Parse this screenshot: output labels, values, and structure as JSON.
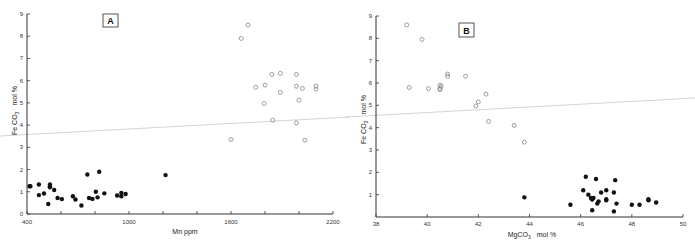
{
  "chart_data": [
    {
      "panel": "A",
      "type": "scatter",
      "title": "",
      "xlabel": "Mn  ppm",
      "ylabel": "Fe CO3  mol %",
      "xlim": [
        400,
        2200
      ],
      "ylim": [
        0,
        9
      ],
      "xticks": [
        400,
        600,
        800,
        1000,
        1200,
        1400,
        1600,
        1800,
        2000,
        2200
      ],
      "xtick_labels": [
        "400",
        "",
        "",
        "1000",
        "",
        "",
        "1600",
        "",
        "",
        "2200"
      ],
      "yticks": [
        0,
        1,
        2,
        3,
        4,
        5,
        6,
        7,
        8,
        9
      ],
      "grid": false,
      "series": [
        {
          "name": "filled",
          "marker": "filled-circle",
          "points": [
            [
              415,
              1.25
            ],
            [
              420,
              1.25
            ],
            [
              470,
              1.33
            ],
            [
              470,
              0.85
            ],
            [
              500,
              0.92
            ],
            [
              525,
              0.45
            ],
            [
              535,
              1.33
            ],
            [
              535,
              1.25
            ],
            [
              535,
              1.2
            ],
            [
              560,
              1.08
            ],
            [
              580,
              0.72
            ],
            [
              605,
              0.67
            ],
            [
              670,
              0.8
            ],
            [
              685,
              0.65
            ],
            [
              720,
              0.38
            ],
            [
              755,
              1.78
            ],
            [
              765,
              0.72
            ],
            [
              785,
              0.68
            ],
            [
              805,
              1.0
            ],
            [
              815,
              0.75
            ],
            [
              825,
              1.9
            ],
            [
              855,
              0.93
            ],
            [
              930,
              0.83
            ],
            [
              955,
              0.95
            ],
            [
              955,
              0.8
            ],
            [
              980,
              0.9
            ],
            [
              1215,
              1.75
            ]
          ]
        },
        {
          "name": "open",
          "marker": "open-circle",
          "points": [
            [
              1600,
              3.35
            ],
            [
              1660,
              7.9
            ],
            [
              1700,
              8.5
            ],
            [
              1745,
              5.7
            ],
            [
              1800,
              5.8
            ],
            [
              1795,
              4.97
            ],
            [
              1840,
              6.28
            ],
            [
              1845,
              4.22
            ],
            [
              1890,
              6.33
            ],
            [
              1890,
              5.47
            ],
            [
              1985,
              6.28
            ],
            [
              1985,
              5.75
            ],
            [
              1985,
              4.1
            ],
            [
              2000,
              5.12
            ],
            [
              2020,
              5.65
            ],
            [
              2035,
              3.32
            ],
            [
              2100,
              5.75
            ],
            [
              2100,
              5.62
            ]
          ]
        }
      ],
      "annotations": [
        "A"
      ]
    },
    {
      "panel": "B",
      "type": "scatter",
      "title": "",
      "xlabel": "MgCO3  mol %",
      "ylabel": "Fe CO3  mol %",
      "xlim": [
        38,
        50
      ],
      "ylim": [
        0,
        9
      ],
      "xticks": [
        38,
        40,
        42,
        44,
        46,
        48,
        50
      ],
      "xtick_labels": [
        "38",
        "40",
        "42",
        "44",
        "46",
        "48",
        "50"
      ],
      "yticks": [
        1,
        2,
        3,
        4,
        5,
        6,
        7,
        8,
        9
      ],
      "grid": false,
      "series": [
        {
          "name": "open",
          "marker": "open-circle",
          "points": [
            [
              39.2,
              8.6
            ],
            [
              39.3,
              5.8
            ],
            [
              39.8,
              7.95
            ],
            [
              40.05,
              5.75
            ],
            [
              40.5,
              5.9
            ],
            [
              40.5,
              5.75
            ],
            [
              40.55,
              5.85
            ],
            [
              40.5,
              5.7
            ],
            [
              40.8,
              6.4
            ],
            [
              40.8,
              6.3
            ],
            [
              41.5,
              6.3
            ],
            [
              41.9,
              4.97
            ],
            [
              42.0,
              5.15
            ],
            [
              42.3,
              5.5
            ],
            [
              42.4,
              4.28
            ],
            [
              43.4,
              4.1
            ],
            [
              43.8,
              3.35
            ]
          ]
        },
        {
          "name": "filled",
          "marker": "filled-circle",
          "points": [
            [
              43.8,
              0.88
            ],
            [
              45.6,
              0.55
            ],
            [
              46.1,
              1.2
            ],
            [
              46.2,
              1.8
            ],
            [
              46.3,
              1.0
            ],
            [
              46.4,
              0.85
            ],
            [
              46.45,
              0.78
            ],
            [
              46.5,
              0.85
            ],
            [
              46.45,
              0.3
            ],
            [
              46.6,
              1.7
            ],
            [
              46.65,
              0.6
            ],
            [
              46.7,
              0.7
            ],
            [
              46.8,
              1.1
            ],
            [
              47.0,
              1.2
            ],
            [
              47.0,
              0.8
            ],
            [
              47.0,
              0.75
            ],
            [
              47.3,
              1.1
            ],
            [
              47.35,
              1.65
            ],
            [
              47.3,
              0.25
            ],
            [
              47.4,
              0.6
            ],
            [
              48.0,
              0.55
            ],
            [
              48.3,
              0.55
            ],
            [
              48.65,
              0.8
            ],
            [
              48.65,
              0.75
            ],
            [
              48.95,
              0.65
            ]
          ]
        }
      ],
      "annotations": [
        "B"
      ]
    }
  ],
  "panels": {
    "a": {
      "label": "A",
      "xlabel": "Mn  ppm",
      "ylabel_main": "Fe CO",
      "ylabel_sub": "3",
      "ylabel_unit": "mol %",
      "xtick_labels": [
        "400",
        "1000",
        "1600",
        "2200"
      ],
      "ytick_labels": [
        "0",
        "1",
        "2",
        "3",
        "4",
        "5",
        "6",
        "7",
        "8",
        "9"
      ]
    },
    "b": {
      "label": "B",
      "xlabel_main": "MgCO",
      "xlabel_sub": "3",
      "xlabel_unit": "mol %",
      "ylabel_main": "Fe CO",
      "ylabel_sub": "3",
      "ylabel_unit": "mol %",
      "xtick_labels": [
        "38",
        "40",
        "42",
        "44",
        "46",
        "48",
        "50"
      ],
      "ytick_labels": [
        "1",
        "2",
        "3",
        "4",
        "5",
        "6",
        "7",
        "8",
        "9"
      ]
    }
  }
}
